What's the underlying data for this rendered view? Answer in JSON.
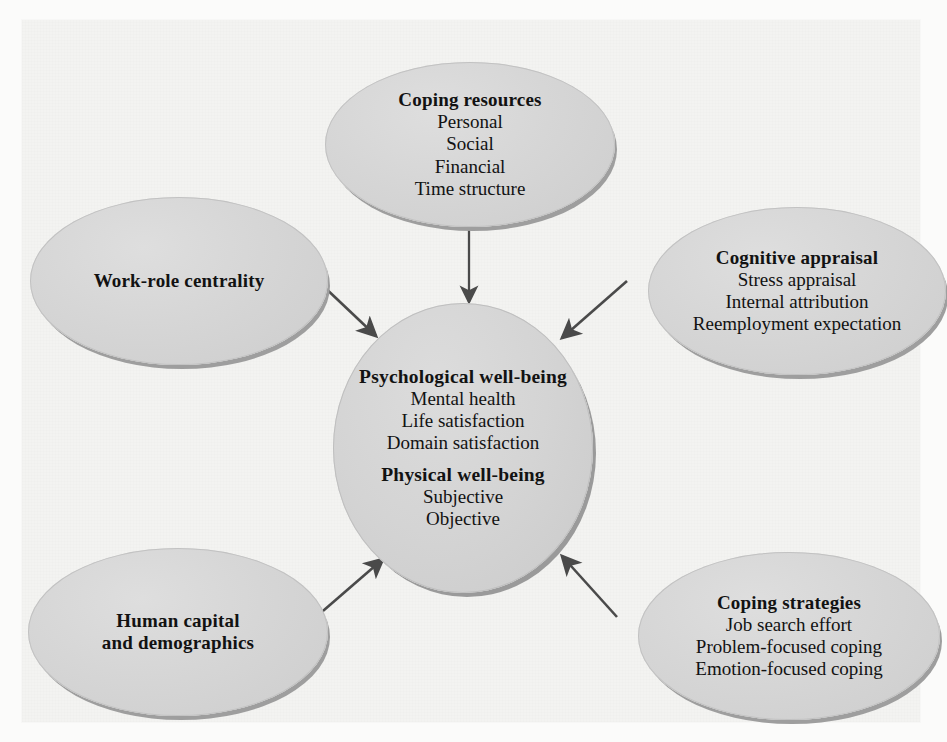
{
  "diagram": {
    "type": "conceptual-model",
    "background_color": "#f3f3f1",
    "node_fill_color": "#d6d6d6",
    "node_shadow_color": "#9e9e9e",
    "text_color": "#121212",
    "arrow_color": "#4a4a4a",
    "nodes": [
      {
        "id": "coping-resources",
        "header": "Coping resources",
        "lines": [
          "Personal",
          "Social",
          "Financial",
          "Time structure"
        ]
      },
      {
        "id": "cognitive-appraisal",
        "header": "Cognitive appraisal",
        "lines": [
          "Stress appraisal",
          "Internal attribution",
          "Reemployment expectation"
        ]
      },
      {
        "id": "work-role-centrality",
        "header": "Work-role centrality",
        "lines": []
      },
      {
        "id": "human-capital",
        "header": "Human capital",
        "header2": "and demographics",
        "lines": []
      },
      {
        "id": "coping-strategies",
        "header": "Coping strategies",
        "lines": [
          "Job search effort",
          "Problem-focused coping",
          "Emotion-focused coping"
        ]
      },
      {
        "id": "center-wellbeing",
        "header": "Psychological well-being",
        "lines": [
          "Mental health",
          "Life satisfaction",
          "Domain satisfaction"
        ],
        "header2": "Physical well-being",
        "lines2": [
          "Subjective",
          "Objective"
        ]
      }
    ],
    "edges": [
      {
        "id": "edge-coping-resources-to-center",
        "from": "coping-resources",
        "to": "center-wellbeing",
        "direction": "one-way"
      },
      {
        "id": "edge-cognitive-appraisal-to-center",
        "from": "cognitive-appraisal",
        "to": "center-wellbeing",
        "direction": "one-way"
      },
      {
        "id": "edge-work-role-to-center",
        "from": "work-role-centrality",
        "to": "center-wellbeing",
        "direction": "one-way"
      },
      {
        "id": "edge-human-capital-to-center",
        "from": "human-capital",
        "to": "center-wellbeing",
        "direction": "one-way"
      },
      {
        "id": "edge-coping-strategies-to-center",
        "from": "coping-strategies",
        "to": "center-wellbeing",
        "direction": "one-way"
      }
    ]
  }
}
